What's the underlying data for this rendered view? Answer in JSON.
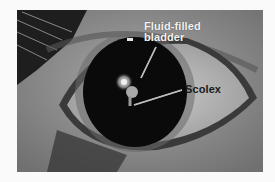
{
  "figure": {
    "colors": {
      "background": "#fafafa",
      "sclera": "#b8b8b8",
      "pupil": "#0a0a0a",
      "label_light": "#f2f2f2",
      "label_dark": "#1a1a1a"
    },
    "labels": {
      "bladder_line1": "Fluid-filled",
      "bladder_line2": "bladder",
      "scolex": "Scolex"
    }
  }
}
